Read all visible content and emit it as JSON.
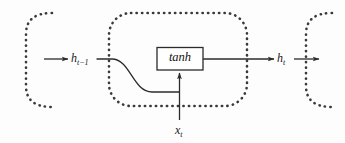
{
  "figure": {
    "kind": "rnn-cell-diagram",
    "background_color": "#fdfdfd",
    "stroke_color": "#2b2b2b",
    "dotted_color": "#3a3a3a"
  },
  "cells": {
    "previous": {
      "name": "previous-timestep-cell",
      "style": "dotted-rounded-rect-partial"
    },
    "current": {
      "name": "current-timestep-cell",
      "style": "dotted-rounded-rect"
    },
    "next": {
      "name": "next-timestep-cell",
      "style": "dotted-rounded-rect-partial"
    }
  },
  "operator": {
    "label": "tanh",
    "shape": "rectangle"
  },
  "labels": {
    "hidden_prev_base": "h",
    "hidden_prev_sub": "t−1",
    "hidden_next_base": "h",
    "hidden_next_sub": "t",
    "input_base": "x",
    "input_sub": "t"
  },
  "edges": [
    {
      "name": "hidden-state-in-arrow",
      "from": "previous-cell",
      "to": "h_{t-1}"
    },
    {
      "name": "hidden-state-curve",
      "from": "h_{t-1}",
      "to": "tanh-input-junction"
    },
    {
      "name": "input-vertical-arrow",
      "from": "x_t",
      "to": "tanh"
    },
    {
      "name": "tanh-output-arrow",
      "from": "tanh",
      "to": "h_t"
    },
    {
      "name": "hidden-state-out-arrow",
      "from": "h_t",
      "to": "next-cell"
    }
  ]
}
